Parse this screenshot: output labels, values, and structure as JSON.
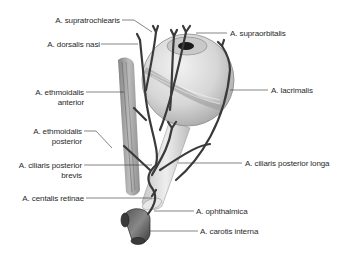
{
  "diagram": {
    "colors": {
      "background": "#ffffff",
      "vessel": "#3c3c3c",
      "eyeball": "#d9d9d9",
      "eyeball_shade": "#b8b8b8",
      "muscle": "#8a8a8a",
      "leader_line": "#333333",
      "text": "#2a2a2a"
    },
    "labels_left": [
      {
        "id": "supratrochlearis",
        "text": "A. supratrochlearis"
      },
      {
        "id": "dorsalis_nasi",
        "text": "A. dorsalis nasi"
      },
      {
        "id": "ethmoidalis_anterior_1",
        "text": "A. ethmoidalis"
      },
      {
        "id": "ethmoidalis_anterior_2",
        "text": "anterior"
      },
      {
        "id": "ethmoidalis_posterior_1",
        "text": "A. ethmoidalis"
      },
      {
        "id": "ethmoidalis_posterior_2",
        "text": "posterior"
      },
      {
        "id": "ciliaris_posterior_brevis_1",
        "text": "A. ciliaris posterior"
      },
      {
        "id": "ciliaris_posterior_brevis_2",
        "text": "brevis"
      },
      {
        "id": "centalis_retinae",
        "text": "A. centalis retinae"
      }
    ],
    "labels_right": [
      {
        "id": "supraorbitalis",
        "text": "A. supraorbitalis"
      },
      {
        "id": "lacrimalis",
        "text": "A. lacrimalis"
      },
      {
        "id": "ciliaris_posterior_longa",
        "text": "A. ciliaris posterior longa"
      },
      {
        "id": "ophthalmica",
        "text": "A. ophthalmica"
      },
      {
        "id": "carotis_interna",
        "text": "A. carotis interna"
      }
    ]
  }
}
